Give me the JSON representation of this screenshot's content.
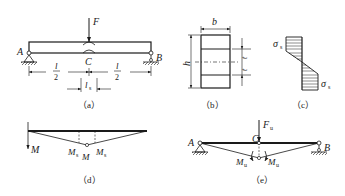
{
  "figure": {
    "panels": [
      {
        "id": "a",
        "caption": "（a）"
      },
      {
        "id": "b",
        "caption": "（b）"
      },
      {
        "id": "c",
        "caption": "（c）"
      },
      {
        "id": "d",
        "caption": "（d）"
      },
      {
        "id": "e",
        "caption": "（e）"
      }
    ]
  },
  "panel_a": {
    "force_label": "F",
    "support_left": "A",
    "support_right": "B",
    "midpoint": "C",
    "half_span_numer": "l",
    "half_span_denom": "2",
    "hinge_length": "l",
    "hinge_length_sub": "s"
  },
  "panel_b": {
    "width_label": "b",
    "height_label": "h",
    "t_label_1": "t",
    "t_label_2": "t"
  },
  "panel_c": {
    "stress_top": "σ",
    "stress_top_sub": "s",
    "stress_bottom": "σ",
    "stress_bottom_sub": "s"
  },
  "panel_d": {
    "moment_left": "M",
    "ms_left": "M",
    "ms_left_sub": "s",
    "m_center": "M",
    "ms_right": "M",
    "ms_right_sub": "s"
  },
  "panel_e": {
    "force_label": "F",
    "force_sub": "u",
    "support_left": "A",
    "support_right": "B",
    "midpoint": "C",
    "mu_left": "M",
    "mu_left_sub": "u",
    "mu_right": "M",
    "mu_right_sub": "u"
  }
}
